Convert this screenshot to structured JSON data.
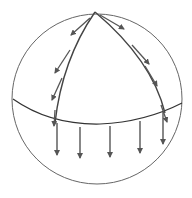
{
  "diagram": {
    "colors": {
      "outline": "#555555",
      "arrow": "#555555",
      "background": "#ffffff"
    },
    "elements": {
      "sphere": "circle-outline",
      "equator": "curved-line",
      "meridians": [
        "left-meridian",
        "right-meridian"
      ],
      "left_meridian_arrows": 3,
      "right_meridian_arrows": 4,
      "equator_arrows": 5
    }
  }
}
